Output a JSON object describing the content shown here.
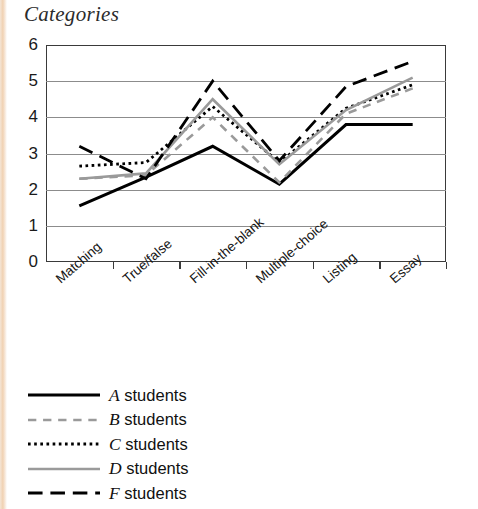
{
  "page": {
    "title": "Categories"
  },
  "chart_data": {
    "type": "line",
    "title": "Categories",
    "xlabel": "",
    "ylabel": "",
    "ylim": [
      0,
      6
    ],
    "yticks": [
      0,
      1,
      2,
      3,
      4,
      5,
      6
    ],
    "grid": true,
    "legend_position": "bottom-left",
    "categories": [
      "Matching",
      "True/false",
      "Fill-in-the-blank",
      "Multiple-choice",
      "Listing",
      "Essay"
    ],
    "series": [
      {
        "name": "A students",
        "grade": "A",
        "label_suffix": " students",
        "style": "solid",
        "color": "#000000",
        "width": 3.0,
        "values": [
          1.55,
          2.35,
          3.2,
          2.15,
          3.8,
          3.8
        ]
      },
      {
        "name": "B students",
        "grade": "B",
        "label_suffix": " students",
        "style": "dashed",
        "color": "#9a9a9a",
        "width": 2.6,
        "values": [
          2.3,
          2.4,
          4.0,
          2.2,
          4.1,
          4.8
        ]
      },
      {
        "name": "C students",
        "grade": "C",
        "label_suffix": " students",
        "style": "dotted",
        "color": "#000000",
        "width": 2.8,
        "values": [
          2.65,
          2.75,
          4.3,
          2.75,
          4.25,
          4.9
        ]
      },
      {
        "name": "D students",
        "grade": "D",
        "label_suffix": " students",
        "style": "solid",
        "color": "#9a9a9a",
        "width": 2.6,
        "values": [
          2.3,
          2.45,
          4.5,
          2.7,
          4.2,
          5.1
        ]
      },
      {
        "name": "F students",
        "grade": "F",
        "label_suffix": " students",
        "style": "longdash",
        "color": "#000000",
        "width": 2.8,
        "values": [
          3.2,
          2.3,
          5.0,
          2.8,
          4.85,
          5.55
        ]
      }
    ]
  },
  "legend": {
    "items": [
      {
        "grade": "A",
        "text": " students",
        "swatch": "legend-swatch-a"
      },
      {
        "grade": "B",
        "text": " students",
        "swatch": "legend-swatch-b"
      },
      {
        "grade": "C",
        "text": " students",
        "swatch": "legend-swatch-c"
      },
      {
        "grade": "D",
        "text": " students",
        "swatch": "legend-swatch-d"
      },
      {
        "grade": "F",
        "text": " students",
        "swatch": "legend-swatch-f"
      }
    ]
  }
}
